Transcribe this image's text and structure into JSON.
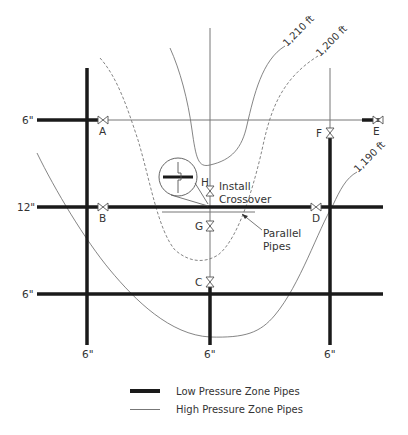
{
  "diagram": {
    "type": "water-distribution-pressure-zone-map",
    "contours": [
      {
        "label": "1,210 ft",
        "style": "solid"
      },
      {
        "label": "1,200 ft",
        "style": "dashed"
      },
      {
        "label": "1,190 ft",
        "style": "solid"
      }
    ],
    "pipe_size_labels": {
      "row_top": "6\"",
      "row_middle": "12\"",
      "row_bottom": "6\"",
      "col_left": "6\"",
      "col_middle": "6\"",
      "col_right": "6\""
    },
    "valves": [
      {
        "id": "A"
      },
      {
        "id": "B"
      },
      {
        "id": "C"
      },
      {
        "id": "D"
      },
      {
        "id": "E"
      },
      {
        "id": "F"
      },
      {
        "id": "G"
      },
      {
        "id": "H"
      }
    ],
    "annotations": {
      "crossover_line1": "Install",
      "crossover_line2": "Crossover",
      "parallel_line1": "Parallel",
      "parallel_line2": "Pipes"
    },
    "colors": {
      "low_pressure_pipe": "#1a1a1a",
      "high_pressure_pipe": "#777777",
      "contour": "#666666"
    }
  },
  "legend": {
    "items": [
      {
        "label": "Low Pressure Zone Pipes",
        "style": "thick"
      },
      {
        "label": "High Pressure Zone Pipes",
        "style": "thin"
      }
    ]
  }
}
